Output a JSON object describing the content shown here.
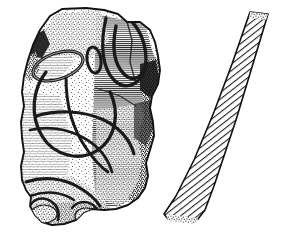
{
  "figure": {
    "kind": "archaeological-line-drawing",
    "title": "Carved stone fragment with cross-section profile",
    "background_color": "#ffffff",
    "ink_color": "#1a1a1a",
    "canvas": {
      "width": 283,
      "height": 235
    },
    "objects": [
      {
        "id": "stone-fragment",
        "label": "Carved stone fragment (front view)",
        "technique": "stipple and line shading",
        "bounds": {
          "x": 18,
          "y": 8,
          "width": 148,
          "height": 220
        }
      },
      {
        "id": "section-profile",
        "label": "Hatched cross-section profile",
        "technique": "diagonal hatching",
        "bounds": {
          "x": 160,
          "y": 10,
          "width": 112,
          "height": 212
        }
      }
    ],
    "motifs": [
      {
        "id": "motif-left-oval",
        "label": "Left oval loop groove"
      },
      {
        "id": "motif-centre-oval",
        "label": "Small central oval groove"
      },
      {
        "id": "motif-right-horseshoe",
        "label": "Right horseshoe loop groove"
      },
      {
        "id": "motif-circle-arc",
        "label": "Large intersecting circular arcs"
      },
      {
        "id": "motif-lower-curve",
        "label": "Lower sweeping curve groove"
      },
      {
        "id": "motif-basal-lobes",
        "label": "Basal lobed protrusions"
      }
    ],
    "shading": {
      "stipple_density_label": "dense stipple",
      "hatch_angle_label": "35 degrees",
      "hatch_spacing_px": 4,
      "dark_edge_label": "heavy shadow on right margin"
    }
  }
}
